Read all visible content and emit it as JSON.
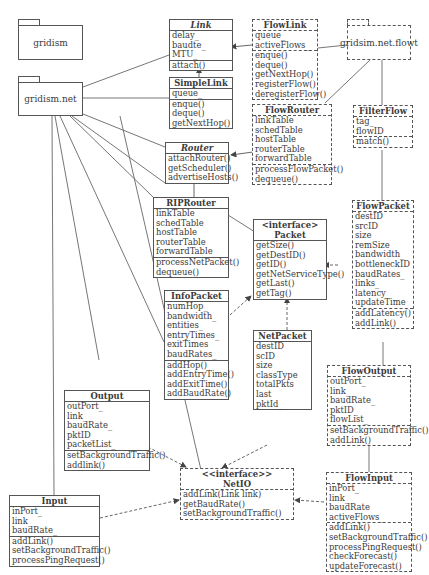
{
  "packages": [
    {
      "id": "pkg-gridism",
      "label": "gridism"
    },
    {
      "id": "pkg-gridism-net",
      "label": "gridism.net"
    },
    {
      "id": "pkg-gridsim-net-flowt",
      "label": "gridsim.net.flowt"
    }
  ],
  "classes": {
    "link": {
      "title": "Link",
      "attributes": [
        "delay_",
        "baudte_",
        "MTU_"
      ],
      "methods": [
        "attach()"
      ]
    },
    "simplelink": {
      "title": "SimpleLink",
      "attributes": [
        "queue_"
      ],
      "methods": [
        "enque()",
        "deque()",
        "getNextHop()"
      ]
    },
    "router": {
      "title": "Router",
      "attributes": [],
      "methods": [
        "attachRouter()",
        "getScheduler()",
        "advertiseHosts()"
      ]
    },
    "riprouter": {
      "title": "RIPRouter",
      "attributes": [
        "linkTable",
        "schedTable",
        "hostTable",
        "routerTable",
        "forwardTable"
      ],
      "methods": [
        "processNetPacket()",
        "dequeue()"
      ]
    },
    "flowlink": {
      "title": "FlowLink",
      "attributes": [
        "queue_",
        "activeFlows_"
      ],
      "methods": [
        "enque()",
        "deque()",
        "getNextHop()",
        "registerFlow()",
        "deregisterFlow()"
      ]
    },
    "flowrouter": {
      "title": "FlowRouter",
      "attributes": [
        "linkTable",
        "schedTable",
        "hostTable",
        "routerTable",
        "forwardTable"
      ],
      "methods": [
        "processFlowPacket()",
        "dequeue()"
      ]
    },
    "filterflow": {
      "title": "FilterFlow",
      "attributes": [
        "tag_",
        "flowID_"
      ],
      "methods": [
        "match()"
      ]
    },
    "packet": {
      "stereotype": "<interface>",
      "title": "Packet",
      "attributes": [],
      "methods": [
        "getSize()",
        "getDestID()",
        "getID()",
        "getNetServiceType()",
        "getLast()",
        "getTag()"
      ]
    },
    "flowpacket": {
      "title": "FlowPacket",
      "attributes": [
        "destID",
        "srcID",
        "size",
        "remSize",
        "bandwidth_",
        "bottleneckID",
        "baudRates_",
        "links_",
        "latency",
        "updateTime"
      ],
      "methods": [
        "addLatency()",
        "addLink()"
      ]
    },
    "infopacket": {
      "title": "InfoPacket",
      "attributes": [
        "numHop_",
        "bandwidth_",
        "entities_",
        "entryTimes_",
        "exitTimes",
        "baudRates_"
      ],
      "methods": [
        "addHop()",
        "addEntryTime()",
        "addExitTime()",
        "addBaudRate()"
      ]
    },
    "netpacket": {
      "title": "NetPacket",
      "attributes": [
        "destID",
        "scID",
        "size",
        "classType",
        "totalPkts",
        "last",
        "pktId_"
      ],
      "methods": []
    },
    "output": {
      "title": "Output",
      "attributes": [
        "outPort_",
        "link_",
        "baudRate_",
        "pktID_",
        "packetList_"
      ],
      "methods": [
        "setBackgroundTraffic()",
        "addlink()"
      ]
    },
    "flowoutput": {
      "title": "FlowOutput",
      "attributes": [
        "outPort_",
        "link_",
        "baudRate_",
        "pktID_",
        "flowList_"
      ],
      "methods": [
        "setBackgroundTraffic()",
        "addLink()"
      ]
    },
    "netio": {
      "stereotype": "<<interface>>",
      "title": "NetIO",
      "attributes": [],
      "methods": [
        "addLink(Link link)",
        "getBaudRate()",
        "setBackgroundTraffic()"
      ]
    },
    "flowinput": {
      "title": "FlowInput",
      "attributes": [
        "inPort_",
        "link_",
        "baudRate",
        "activeFlows_"
      ],
      "methods": [
        "addLink()",
        "setBackgroundTraffic()",
        "processPingRequest()",
        "checkForecast()",
        "updateForecast()"
      ]
    },
    "input": {
      "title": "Input",
      "attributes": [
        "inPort_",
        "link_",
        "baudRate_"
      ],
      "methods": [
        "addLink()",
        "setBackgroundTraffic()",
        "processPingRequest()"
      ]
    }
  },
  "colors": {
    "line": "#555555",
    "text": "#3a3a3a",
    "background": "#ffffff"
  }
}
